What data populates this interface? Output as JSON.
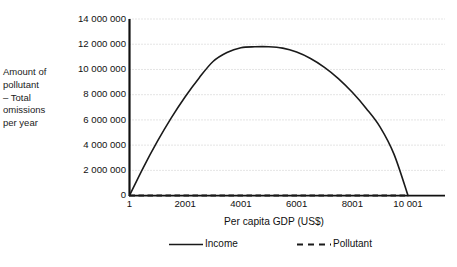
{
  "chart_data": {
    "type": "line",
    "title": "",
    "xlabel": "Per capita GDP (US$)",
    "ylabel": "Amount of pollutant\n– Total\nomissions\nper year",
    "ylabel_lines": [
      "Amount of",
      "pollutant",
      "– Total",
      "omissions",
      "per year"
    ],
    "x": [
      1,
      501,
      1001,
      1501,
      2001,
      2501,
      3001,
      3501,
      4001,
      4501,
      5001,
      5501,
      6001,
      6501,
      7001,
      7501,
      8001,
      8501,
      9001,
      9501,
      10001
    ],
    "xlim": [
      1,
      10001
    ],
    "ylim": [
      0,
      14000000
    ],
    "grid": true,
    "grid_axis": "y",
    "legend_position": "bottom",
    "x_tick_labels": [
      "1",
      "2001",
      "4001",
      "6001",
      "8001",
      "10 001"
    ],
    "x_tick_values": [
      1,
      2001,
      4001,
      6001,
      8001,
      10001
    ],
    "y_tick_labels": [
      "0",
      "2 000 000",
      "4 000 000",
      "6 000 000",
      "8 000 000",
      "10 000 000",
      "12 000 000",
      "14 000 000"
    ],
    "y_tick_values": [
      0,
      2000000,
      4000000,
      6000000,
      8000000,
      10000000,
      12000000,
      14000000
    ],
    "series": [
      {
        "name": "Income",
        "style": "solid",
        "color": "#1a1a1a",
        "values": [
          0,
          2240000,
          4290000,
          6160000,
          7840000,
          9330000,
          10630000,
          11340000,
          11720000,
          11800000,
          11800000,
          11690000,
          11380000,
          10870000,
          10170000,
          9280000,
          8190000,
          6910000,
          5430000,
          3270000,
          0
        ]
      },
      {
        "name": "Pollutant",
        "style": "dashed",
        "color": "#1a1a1a",
        "values": [
          0,
          0,
          0,
          0,
          0,
          0,
          0,
          0,
          0,
          0,
          0,
          0,
          0,
          0,
          0,
          0,
          0,
          0,
          0,
          0,
          0
        ]
      }
    ],
    "peak": {
      "x": 5001,
      "y": 11800000
    }
  },
  "legend": {
    "income_label": "Income",
    "pollutant_label": "Pollutant"
  },
  "colors": {
    "line": "#1a1a1a",
    "grid": "#c9c9c9",
    "axis": "#111111",
    "background": "#ffffff"
  }
}
